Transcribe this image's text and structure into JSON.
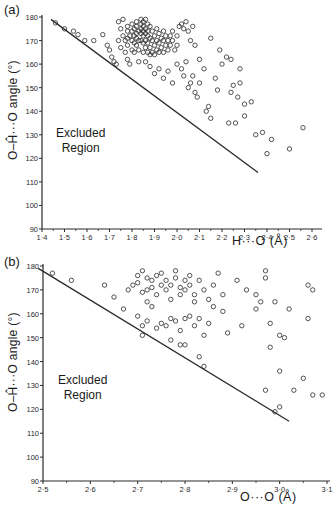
{
  "chart_data": [
    {
      "panel": "(a)",
      "type": "scatter",
      "xlabel": "H···O (Å)",
      "ylabel": "O–Ĥ···O angle (°)",
      "xlim": [
        1.4,
        2.6
      ],
      "ylim": [
        90,
        180
      ],
      "x_ticks": [
        "1·4",
        "1·5",
        "1·6",
        "1·7",
        "1·8",
        "1·9",
        "2·0",
        "2·1",
        "2·2",
        "2·3",
        "2·4",
        "2·5",
        "2·6"
      ],
      "y_ticks": [
        "90",
        "100",
        "110",
        "120",
        "130",
        "140",
        "150",
        "160",
        "170",
        "180"
      ],
      "grid": false,
      "annotation": [
        "Excluded",
        "Region"
      ],
      "boundary_line": [
        [
          1.44,
          179
        ],
        [
          2.36,
          114
        ]
      ],
      "points": [
        [
          1.46,
          177.5
        ],
        [
          1.5,
          175
        ],
        [
          1.54,
          174
        ],
        [
          1.56,
          172.5
        ],
        [
          1.59,
          170
        ],
        [
          1.63,
          170
        ],
        [
          1.67,
          172.5
        ],
        [
          1.69,
          168
        ],
        [
          1.7,
          166
        ],
        [
          1.71,
          163
        ],
        [
          1.72,
          161
        ],
        [
          1.73,
          160
        ],
        [
          1.74,
          178
        ],
        [
          1.74,
          170
        ],
        [
          1.75,
          175
        ],
        [
          1.75,
          167
        ],
        [
          1.76,
          179
        ],
        [
          1.76,
          172
        ],
        [
          1.77,
          170
        ],
        [
          1.77,
          165
        ],
        [
          1.78,
          176
        ],
        [
          1.78,
          174
        ],
        [
          1.78,
          171
        ],
        [
          1.78,
          168
        ],
        [
          1.78,
          162
        ],
        [
          1.79,
          160
        ],
        [
          1.79,
          172
        ],
        [
          1.8,
          177
        ],
        [
          1.8,
          174
        ],
        [
          1.8,
          170
        ],
        [
          1.8,
          166
        ],
        [
          1.81,
          175
        ],
        [
          1.81,
          172
        ],
        [
          1.81,
          169
        ],
        [
          1.81,
          165
        ],
        [
          1.82,
          178
        ],
        [
          1.82,
          176
        ],
        [
          1.82,
          173
        ],
        [
          1.82,
          171
        ],
        [
          1.82,
          168
        ],
        [
          1.83,
          174
        ],
        [
          1.83,
          170
        ],
        [
          1.83,
          166
        ],
        [
          1.83,
          161
        ],
        [
          1.84,
          179
        ],
        [
          1.84,
          177
        ],
        [
          1.84,
          175
        ],
        [
          1.84,
          173
        ],
        [
          1.84,
          170
        ],
        [
          1.85,
          178
        ],
        [
          1.85,
          176
        ],
        [
          1.85,
          174
        ],
        [
          1.85,
          172
        ],
        [
          1.85,
          169
        ],
        [
          1.85,
          165
        ],
        [
          1.86,
          179
        ],
        [
          1.86,
          175
        ],
        [
          1.86,
          173
        ],
        [
          1.86,
          170
        ],
        [
          1.86,
          167
        ],
        [
          1.87,
          177
        ],
        [
          1.87,
          174
        ],
        [
          1.87,
          172
        ],
        [
          1.87,
          169
        ],
        [
          1.87,
          165
        ],
        [
          1.88,
          176
        ],
        [
          1.88,
          171
        ],
        [
          1.88,
          167
        ],
        [
          1.88,
          164
        ],
        [
          1.89,
          174
        ],
        [
          1.89,
          170
        ],
        [
          1.89,
          165
        ],
        [
          1.9,
          172
        ],
        [
          1.9,
          168
        ],
        [
          1.9,
          164
        ],
        [
          1.91,
          175
        ],
        [
          1.91,
          170
        ],
        [
          1.91,
          166
        ],
        [
          1.92,
          173
        ],
        [
          1.92,
          169
        ],
        [
          1.92,
          165
        ],
        [
          1.93,
          171
        ],
        [
          1.93,
          167
        ],
        [
          1.94,
          174
        ],
        [
          1.94,
          170
        ],
        [
          1.94,
          165
        ],
        [
          1.95,
          172
        ],
        [
          1.95,
          168
        ],
        [
          1.96,
          170
        ],
        [
          1.96,
          166
        ],
        [
          1.97,
          172
        ],
        [
          1.97,
          168
        ],
        [
          1.98,
          174
        ],
        [
          1.98,
          170
        ],
        [
          1.99,
          166
        ],
        [
          2.0,
          172
        ],
        [
          2.0,
          168
        ],
        [
          2.01,
          176
        ],
        [
          2.02,
          177
        ],
        [
          2.03,
          175
        ],
        [
          2.04,
          178
        ],
        [
          2.05,
          174
        ],
        [
          2.06,
          170
        ],
        [
          2.07,
          176
        ],
        [
          2.08,
          168
        ],
        [
          1.86,
          161
        ],
        [
          1.88,
          159
        ],
        [
          1.9,
          156
        ],
        [
          1.92,
          158
        ],
        [
          1.94,
          154
        ],
        [
          1.96,
          157
        ],
        [
          1.98,
          152
        ],
        [
          2.0,
          160
        ],
        [
          2.02,
          158
        ],
        [
          2.03,
          155
        ],
        [
          2.04,
          161
        ],
        [
          2.05,
          150
        ],
        [
          2.06,
          152
        ],
        [
          2.07,
          155
        ],
        [
          2.08,
          148
        ],
        [
          2.09,
          146
        ],
        [
          2.1,
          152
        ],
        [
          2.12,
          158
        ],
        [
          2.13,
          140
        ],
        [
          2.14,
          142
        ],
        [
          2.15,
          137
        ],
        [
          2.17,
          154
        ],
        [
          2.18,
          149
        ],
        [
          2.2,
          160
        ],
        [
          2.22,
          163
        ],
        [
          2.24,
          148
        ],
        [
          2.25,
          151
        ],
        [
          2.27,
          146
        ],
        [
          2.28,
          152
        ],
        [
          2.3,
          143
        ],
        [
          2.33,
          144
        ],
        [
          2.3,
          138
        ],
        [
          2.35,
          130
        ],
        [
          2.4,
          122
        ],
        [
          2.42,
          128
        ],
        [
          2.26,
          135
        ],
        [
          2.23,
          135
        ],
        [
          2.38,
          131
        ],
        [
          2.56,
          133
        ],
        [
          2.5,
          124
        ],
        [
          2.1,
          162
        ],
        [
          2.19,
          166
        ],
        [
          2.15,
          171
        ],
        [
          2.24,
          162
        ],
        [
          2.28,
          158
        ]
      ]
    },
    {
      "panel": "(b)",
      "type": "scatter",
      "xlabel": "O···O (Å)",
      "ylabel": "O–Ĥ···O angle (°)",
      "xlim": [
        2.5,
        3.1
      ],
      "ylim": [
        90,
        180
      ],
      "x_ticks": [
        "2·5",
        "2·6",
        "2·7",
        "2·8",
        "2·9",
        "3·0",
        "3·1"
      ],
      "y_ticks": [
        "90",
        "100",
        "110",
        "120",
        "130",
        "140",
        "150",
        "160",
        "170",
        "180"
      ],
      "grid": false,
      "annotation": [
        "Excluded",
        "Region"
      ],
      "boundary_line": [
        [
          2.49,
          179
        ],
        [
          3.02,
          115
        ]
      ],
      "points": [
        [
          2.52,
          177
        ],
        [
          2.56,
          174
        ],
        [
          2.63,
          172
        ],
        [
          2.65,
          167
        ],
        [
          2.67,
          162
        ],
        [
          2.68,
          170
        ],
        [
          2.69,
          172
        ],
        [
          2.7,
          173
        ],
        [
          2.7,
          176
        ],
        [
          2.71,
          169
        ],
        [
          2.71,
          178
        ],
        [
          2.72,
          175
        ],
        [
          2.72,
          170
        ],
        [
          2.72,
          165
        ],
        [
          2.73,
          171
        ],
        [
          2.73,
          174
        ],
        [
          2.74,
          176
        ],
        [
          2.74,
          168
        ],
        [
          2.75,
          172
        ],
        [
          2.75,
          177
        ],
        [
          2.76,
          170
        ],
        [
          2.76,
          174
        ],
        [
          2.77,
          166
        ],
        [
          2.77,
          172
        ],
        [
          2.78,
          178
        ],
        [
          2.78,
          175
        ],
        [
          2.79,
          171
        ],
        [
          2.79,
          168
        ],
        [
          2.8,
          174
        ],
        [
          2.8,
          170
        ],
        [
          2.81,
          176
        ],
        [
          2.81,
          172
        ],
        [
          2.82,
          168
        ],
        [
          2.82,
          165
        ],
        [
          2.83,
          174
        ],
        [
          2.84,
          170
        ],
        [
          2.85,
          166
        ],
        [
          2.86,
          172
        ],
        [
          2.87,
          177
        ],
        [
          2.88,
          168
        ],
        [
          2.7,
          159
        ],
        [
          2.71,
          155
        ],
        [
          2.72,
          157
        ],
        [
          2.74,
          154
        ],
        [
          2.75,
          156
        ],
        [
          2.76,
          155
        ],
        [
          2.77,
          158
        ],
        [
          2.78,
          157
        ],
        [
          2.79,
          153
        ],
        [
          2.8,
          158
        ],
        [
          2.81,
          159
        ],
        [
          2.82,
          155
        ],
        [
          2.83,
          158
        ],
        [
          2.84,
          151
        ],
        [
          2.85,
          156
        ],
        [
          2.79,
          147
        ],
        [
          2.8,
          147
        ],
        [
          2.83,
          142
        ],
        [
          2.84,
          138
        ],
        [
          2.77,
          149
        ],
        [
          2.71,
          151
        ],
        [
          2.73,
          163
        ],
        [
          2.95,
          162
        ],
        [
          2.96,
          165
        ],
        [
          2.97,
          178
        ],
        [
          2.97,
          175
        ],
        [
          2.98,
          156
        ],
        [
          2.99,
          165
        ],
        [
          3.0,
          151
        ],
        [
          3.01,
          150
        ],
        [
          3.02,
          162
        ],
        [
          3.06,
          172
        ],
        [
          3.07,
          170
        ],
        [
          3.06,
          158
        ],
        [
          3.0,
          136
        ],
        [
          2.98,
          146
        ],
        [
          3.03,
          128
        ],
        [
          3.05,
          133
        ],
        [
          3.07,
          126
        ],
        [
          3.09,
          126
        ],
        [
          2.97,
          128
        ],
        [
          2.99,
          119
        ],
        [
          3.0,
          121
        ],
        [
          2.95,
          168
        ],
        [
          2.93,
          170
        ],
        [
          2.91,
          174
        ],
        [
          2.88,
          161
        ],
        [
          2.86,
          163
        ],
        [
          2.89,
          152
        ],
        [
          2.92,
          155
        ]
      ]
    }
  ]
}
